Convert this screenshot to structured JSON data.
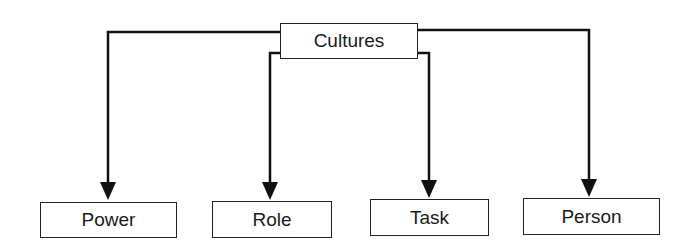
{
  "diagram": {
    "root": {
      "label": "Cultures"
    },
    "children": [
      {
        "label": "Power"
      },
      {
        "label": "Role"
      },
      {
        "label": "Task"
      },
      {
        "label": "Person"
      }
    ],
    "colors": {
      "line": "#111111",
      "box_border": "#222222",
      "text": "#1a1a1a",
      "background": "#ffffff"
    }
  }
}
